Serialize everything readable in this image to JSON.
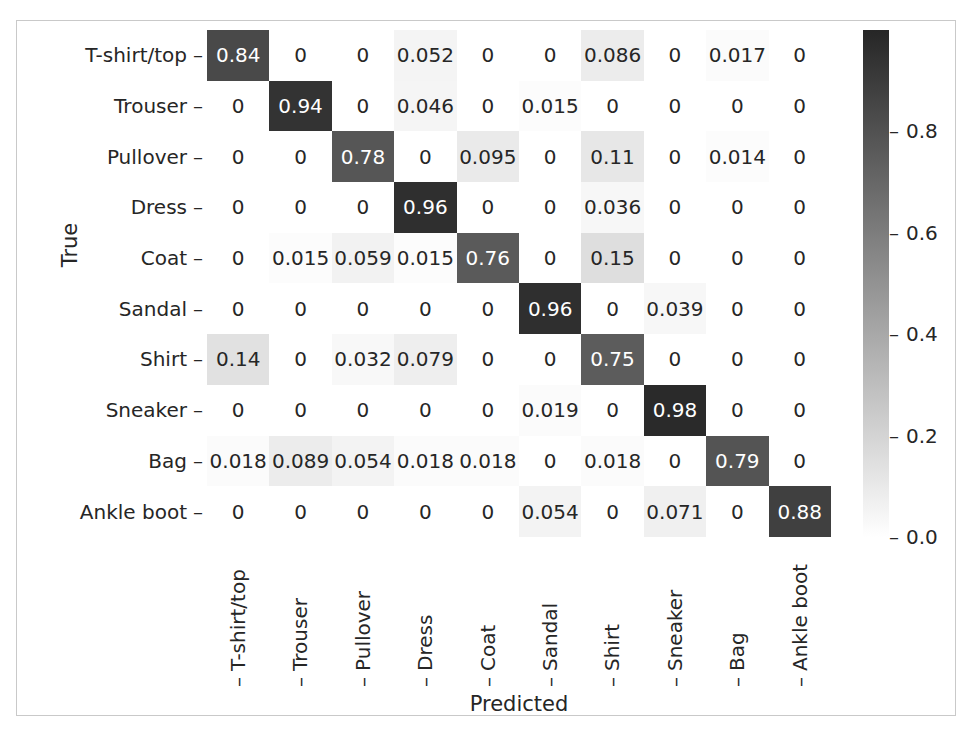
{
  "figure": {
    "clipped_caption": "",
    "frame_color": "#c9c9c9",
    "background": "#ffffff",
    "text_color": "#262626"
  },
  "axis": {
    "xlabel": "Predicted",
    "ylabel": "True",
    "tick_dash": "–"
  },
  "colorbar": {
    "ticks": [
      "0.8",
      "0.6",
      "0.4",
      "0.2",
      "0.0"
    ],
    "tick_values": [
      0.8,
      0.6,
      0.4,
      0.2,
      0.0
    ],
    "vmin": 0.0,
    "vmax": 1.0,
    "colormap": "gray_r",
    "low_color": "#ffffff",
    "high_color": "#262626"
  },
  "chart_data": {
    "type": "heatmap",
    "title": "",
    "xlabel": "Predicted",
    "ylabel": "True",
    "grid": false,
    "legend": "colorbar-right",
    "colormap": "gray_r",
    "vmin": 0.0,
    "vmax": 1.0,
    "categories": [
      "T-shirt/top",
      "Trouser",
      "Pullover",
      "Dress",
      "Coat",
      "Sandal",
      "Shirt",
      "Sneaker",
      "Bag",
      "Ankle boot"
    ],
    "x_tick_labels": [
      "T-shirt/top",
      "Trouser",
      "Pullover",
      "Dress",
      "Coat",
      "Sandal",
      "Shirt",
      "Sneaker",
      "Bag",
      "Ankle boot"
    ],
    "y_tick_labels": [
      "T-shirt/top",
      "Trouser",
      "Pullover",
      "Dress",
      "Coat",
      "Sandal",
      "Shirt",
      "Sneaker",
      "Bag",
      "Ankle boot"
    ],
    "values": [
      [
        0.84,
        0,
        0,
        0.052,
        0,
        0,
        0.086,
        0,
        0.017,
        0
      ],
      [
        0,
        0.94,
        0,
        0.046,
        0,
        0.015,
        0,
        0,
        0,
        0
      ],
      [
        0,
        0,
        0.78,
        0,
        0.095,
        0,
        0.11,
        0,
        0.014,
        0
      ],
      [
        0,
        0,
        0,
        0.96,
        0,
        0,
        0.036,
        0,
        0,
        0
      ],
      [
        0,
        0.015,
        0.059,
        0.015,
        0.76,
        0,
        0.15,
        0,
        0,
        0
      ],
      [
        0,
        0,
        0,
        0,
        0,
        0.96,
        0,
        0.039,
        0,
        0
      ],
      [
        0.14,
        0,
        0.032,
        0.079,
        0,
        0,
        0.75,
        0,
        0,
        0
      ],
      [
        0,
        0,
        0,
        0,
        0,
        0.019,
        0,
        0.98,
        0,
        0
      ],
      [
        0.018,
        0.089,
        0.054,
        0.018,
        0.018,
        0,
        0.018,
        0,
        0.79,
        0
      ],
      [
        0,
        0,
        0,
        0,
        0,
        0.054,
        0,
        0.071,
        0,
        0.88
      ]
    ],
    "labels": [
      [
        "0.84",
        "0",
        "0",
        "0.052",
        "0",
        "0",
        "0.086",
        "0",
        "0.017",
        "0"
      ],
      [
        "0",
        "0.94",
        "0",
        "0.046",
        "0",
        "0.015",
        "0",
        "0",
        "0",
        "0"
      ],
      [
        "0",
        "0",
        "0.78",
        "0",
        "0.095",
        "0",
        "0.11",
        "0",
        "0.014",
        "0"
      ],
      [
        "0",
        "0",
        "0",
        "0.96",
        "0",
        "0",
        "0.036",
        "0",
        "0",
        "0"
      ],
      [
        "0",
        "0.015",
        "0.059",
        "0.015",
        "0.76",
        "0",
        "0.15",
        "0",
        "0",
        "0"
      ],
      [
        "0",
        "0",
        "0",
        "0",
        "0",
        "0.96",
        "0",
        "0.039",
        "0",
        "0"
      ],
      [
        "0.14",
        "0",
        "0.032",
        "0.079",
        "0",
        "0",
        "0.75",
        "0",
        "0",
        "0"
      ],
      [
        "0",
        "0",
        "0",
        "0",
        "0",
        "0.019",
        "0",
        "0.98",
        "0",
        "0"
      ],
      [
        "0.018",
        "0.089",
        "0.054",
        "0.018",
        "0.018",
        "0",
        "0.018",
        "0",
        "0.79",
        "0"
      ],
      [
        "0",
        "0",
        "0",
        "0",
        "0",
        "0.054",
        "0",
        "0.071",
        "0",
        "0.88"
      ]
    ]
  }
}
